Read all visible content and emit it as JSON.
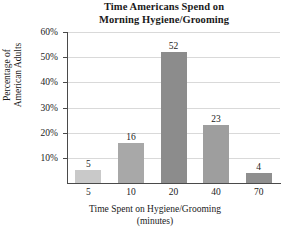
{
  "chart_data": {
    "type": "bar",
    "title": "Time Americans Spend on Morning Hygiene/Grooming",
    "title_lines": [
      "Time Americans Spend on",
      "Morning Hygiene/Grooming"
    ],
    "categories": [
      "5",
      "10",
      "20",
      "40",
      "70"
    ],
    "values": [
      5,
      16,
      52,
      23,
      4
    ],
    "value_labels": [
      "5",
      "16",
      "52",
      "23",
      "4"
    ],
    "bar_colors": [
      "#c9c9c9",
      "#a8a8a8",
      "#8c8c8c",
      "#9e9e9e",
      "#8f8f8f"
    ],
    "xlabel": "Time Spent on Hygiene/Grooming (minutes)",
    "xlabel_lines": [
      "Time Spent on Hygiene/Grooming",
      "(minutes)"
    ],
    "ylabel": "Percentage of American Adults",
    "ylabel_lines": [
      "Percentage of",
      "American Adults"
    ],
    "ylim": [
      0,
      60
    ],
    "yticks": [
      10,
      20,
      30,
      40,
      50,
      60
    ],
    "ytick_labels": [
      "10%",
      "20%",
      "30%",
      "40%",
      "50%",
      "60%"
    ],
    "grid": true,
    "legend": false,
    "axis_color": "#4a4a4a",
    "grid_color": "#d9d9d9",
    "background": "#ffffff"
  }
}
